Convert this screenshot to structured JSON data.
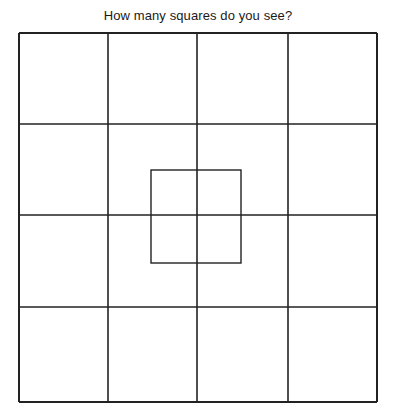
{
  "title": "How many squares do you see?",
  "puzzle": {
    "grid": {
      "rows": 4,
      "cols": 4,
      "x_lines": [
        19,
        108,
        197,
        288,
        377
      ],
      "y_lines": [
        33,
        124,
        215,
        307,
        402
      ]
    },
    "inner_square": {
      "x": 151,
      "y": 170,
      "width": 90,
      "height": 93
    },
    "stroke_color": "#222222"
  }
}
